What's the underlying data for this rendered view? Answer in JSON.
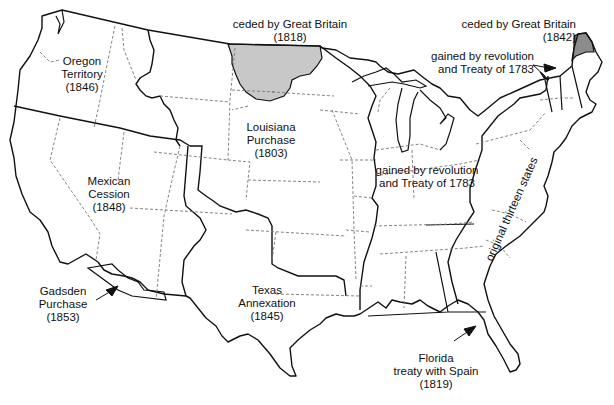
{
  "map": {
    "subject": "Territorial acquisitions of the United States",
    "colors": {
      "background": "#ffffff",
      "outline": "#111111",
      "state_border": "#777777",
      "ceded_1818_fill": "#c8c8c8",
      "ceded_1842_fill": "#8c8c8c"
    },
    "regions": [
      {
        "id": "oregon",
        "lines": [
          "Oregon",
          "Territory",
          "(1846)"
        ]
      },
      {
        "id": "ceded-1818",
        "lines": [
          "ceded by Great Britain",
          "(1818)"
        ]
      },
      {
        "id": "ceded-1842",
        "lines": [
          "ceded by Great Britain",
          "(1842)"
        ]
      },
      {
        "id": "revolution-ne",
        "lines": [
          "gained by revolution",
          "and Treaty of 1783"
        ]
      },
      {
        "id": "louisiana",
        "lines": [
          "Louisiana",
          "Purchase",
          "(1803)"
        ]
      },
      {
        "id": "revolution-mid",
        "lines": [
          "gained by revolution",
          "and Treaty of 1783"
        ]
      },
      {
        "id": "mexican",
        "lines": [
          "Mexican",
          "Cession",
          "(1848)"
        ]
      },
      {
        "id": "original-13",
        "lines": [
          "original thirteen states"
        ]
      },
      {
        "id": "gadsden",
        "lines": [
          "Gadsden",
          "Purchase",
          "(1853)"
        ]
      },
      {
        "id": "texas",
        "lines": [
          "Texas",
          "Annexation",
          "(1845)"
        ]
      },
      {
        "id": "florida",
        "lines": [
          "Florida",
          "treaty with Spain",
          "(1819)"
        ]
      }
    ]
  }
}
